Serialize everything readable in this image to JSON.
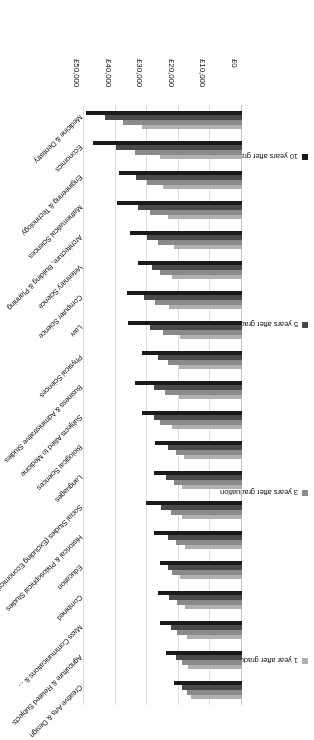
{
  "chart_data": {
    "type": "bar",
    "orientation": "horizontal",
    "title": "",
    "subtitle": "",
    "xlabel": "",
    "ylabel": "",
    "xlim": [
      0,
      50000
    ],
    "xticks": [
      "£0",
      "£10,000",
      "£20,000",
      "£30,000",
      "£40,000",
      "£50,000"
    ],
    "xtick_values": [
      0,
      10000,
      20000,
      30000,
      40000,
      50000
    ],
    "grid": true,
    "legend_position": "left",
    "categories": [
      "Creative Arts & Design",
      "Agriculture & Related Subjects",
      "Mass Communications & ...",
      "Combined",
      "Education",
      "Historical & Philosophical Studies",
      "Social Studies (Excluding Economics)",
      "Languages",
      "Biological Sciences",
      "Subjects Allied to Medicine",
      "Business & Administrative Studies",
      "Physical Sciences",
      "Law",
      "Computer Science",
      "Veterinary Science",
      "Architecture, Building & Planning",
      "Mathematical Sciences",
      "Engineering & Technology",
      "Economics",
      "Medicine & Dentistry"
    ],
    "series": [
      {
        "name": "1 year after graduation",
        "color": "#b0b0b0",
        "values": [
          16000,
          17000,
          17500,
          18000,
          19500,
          18000,
          19000,
          19000,
          18500,
          22000,
          20000,
          20000,
          19500,
          23000,
          22000,
          21500,
          23500,
          25000,
          26000,
          31500
        ]
      },
      {
        "name": "3 years after graduation",
        "color": "#8a8a8a",
        "values": [
          17500,
          19000,
          20500,
          20500,
          22000,
          21000,
          22500,
          21500,
          21000,
          26000,
          24500,
          23500,
          25000,
          27500,
          26000,
          26500,
          29000,
          30000,
          34000,
          37500
        ]
      },
      {
        "name": "5 years after graduation",
        "color": "#4a4a4a",
        "values": [
          19000,
          21000,
          22500,
          23000,
          23500,
          23500,
          25500,
          24000,
          23500,
          28000,
          28000,
          26500,
          29000,
          31000,
          28500,
          30000,
          33000,
          33500,
          40000,
          43500
        ]
      },
      {
        "name": "10 years after graduation",
        "color": "#1a1a1a",
        "values": [
          21500,
          24000,
          26000,
          26500,
          26000,
          28000,
          30500,
          28000,
          27500,
          31500,
          34000,
          31500,
          36000,
          36500,
          33000,
          35500,
          39500,
          39000,
          47000,
          49500
        ]
      }
    ]
  },
  "legend": {
    "items": [
      {
        "label": "1 year after graduation",
        "color": "#b0b0b0"
      },
      {
        "label": "3 years after graduation",
        "color": "#8a8a8a"
      },
      {
        "label": "5 years after graduation",
        "color": "#4a4a4a"
      },
      {
        "label": "10 years after graduation",
        "color": "#1a1a1a"
      }
    ]
  },
  "axis": {
    "tick_labels": [
      "£0",
      "£10,000",
      "£20,000",
      "£30,000",
      "£40,000",
      "£50,000"
    ]
  }
}
